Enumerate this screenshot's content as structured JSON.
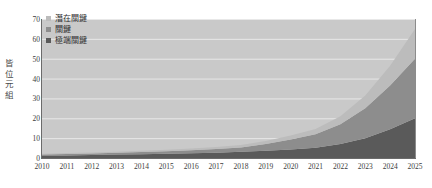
{
  "chart_data": {
    "type": "area",
    "stacked": true,
    "title": "",
    "xlabel": "",
    "ylabel": "皆位元組",
    "categories": [
      2010,
      2011,
      2012,
      2013,
      2014,
      2015,
      2016,
      2017,
      2018,
      2019,
      2020,
      2021,
      2022,
      2023,
      2024,
      2025
    ],
    "xtick_labels": [
      "2010",
      "2011",
      "2012",
      "2013",
      "2014",
      "2015",
      "2016",
      "2017",
      "2018",
      "2019",
      "2020",
      "2021",
      "2022",
      "2023",
      "2024",
      "2025"
    ],
    "ytick_labels": [
      "0",
      "10",
      "20",
      "30",
      "40",
      "50",
      "60",
      "70"
    ],
    "ytick_values": [
      0,
      10,
      20,
      30,
      40,
      50,
      60,
      70
    ],
    "ylim": [
      0,
      70
    ],
    "grid": true,
    "grid_axis": "y",
    "legend_position": "top-left",
    "series": [
      {
        "name": "極端關鍵",
        "color": "#5a5a5a",
        "values": [
          1.2,
          1.3,
          1.5,
          1.7,
          1.9,
          2.1,
          2.4,
          2.7,
          3.1,
          3.6,
          4.3,
          5.2,
          7.0,
          10.0,
          14.5,
          20.0
        ]
      },
      {
        "name": "關鍵",
        "color": "#8d8d8d",
        "values": [
          0.6,
          0.7,
          0.8,
          0.9,
          1.1,
          1.3,
          1.5,
          1.8,
          2.2,
          3.4,
          5.0,
          6.8,
          10.0,
          15.0,
          22.0,
          30.0
        ]
      },
      {
        "name": "潛在關鍵",
        "color": "#bcbcbc",
        "values": [
          0.4,
          0.5,
          0.5,
          0.6,
          0.7,
          0.8,
          0.9,
          1.0,
          1.2,
          1.5,
          2.0,
          2.6,
          4.0,
          6.5,
          10.0,
          15.0
        ]
      }
    ],
    "totals": [
      2.2,
      2.5,
      2.8,
      3.2,
      3.7,
      4.2,
      4.8,
      5.5,
      6.5,
      8.5,
      11.3,
      14.6,
      21.0,
      31.5,
      46.5,
      65.0
    ],
    "plot_background": "#c9c9c9",
    "gridline_color": "#e8e8e8",
    "axis_color": "#6b6b6b"
  },
  "legend": {
    "items": [
      {
        "label": "潛在關鍵",
        "color": "#bcbcbc"
      },
      {
        "label": "關鍵",
        "color": "#8d8d8d"
      },
      {
        "label": "極端關鍵",
        "color": "#5a5a5a"
      }
    ]
  },
  "y_axis": {
    "title_chars": [
      "皆",
      "位",
      "元",
      "組"
    ]
  }
}
